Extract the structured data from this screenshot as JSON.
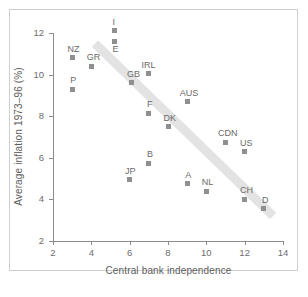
{
  "figure": {
    "background": "#ffffff",
    "frame_color": "#cfcfcf",
    "marker_color": "#8f8f8f",
    "trend_color": "#e2e2e2",
    "axis_color": "#8c8c8c",
    "text_color": "#6a6a6a"
  },
  "chart_data": {
    "type": "scatter",
    "title": "",
    "xlabel": "Central bank independence",
    "ylabel": "Average inflation 1973–96 (%)",
    "xlim": [
      2,
      14
    ],
    "ylim": [
      2,
      12
    ],
    "xticks": [
      2,
      4,
      6,
      8,
      10,
      12,
      14
    ],
    "yticks": [
      2,
      4,
      6,
      8,
      10,
      12
    ],
    "xtick_labels": [
      "2",
      "4",
      "6",
      "8",
      "10",
      "12",
      "14"
    ],
    "ytick_labels": [
      "2",
      "4",
      "6",
      "8",
      "10",
      "12"
    ],
    "grid": false,
    "legend": "none",
    "point_labels": [
      "NZ",
      "P",
      "GR",
      "I",
      "E",
      "JP",
      "GB",
      "B",
      "F",
      "IRL",
      "DK",
      "A",
      "AUS",
      "NL",
      "CDN",
      "US",
      "CH",
      "D"
    ],
    "x": [
      3.0,
      3.0,
      4.0,
      5.2,
      5.2,
      6.0,
      6.1,
      7.0,
      7.0,
      7.0,
      8.0,
      9.0,
      9.0,
      10.0,
      11.0,
      12.0,
      12.0,
      13.0
    ],
    "y": [
      10.8,
      9.3,
      10.4,
      12.1,
      11.6,
      4.95,
      9.6,
      5.75,
      8.15,
      10.05,
      7.5,
      4.75,
      8.7,
      4.4,
      6.75,
      6.3,
      4.0,
      3.55
    ],
    "points": [
      {
        "label": "NZ",
        "x": 3.0,
        "y": 10.8,
        "label_pos": "above"
      },
      {
        "label": "P",
        "x": 3.0,
        "y": 9.3,
        "label_pos": "above"
      },
      {
        "label": "GR",
        "x": 4.0,
        "y": 10.4,
        "label_pos": "above"
      },
      {
        "label": "I",
        "x": 5.2,
        "y": 12.1,
        "label_pos": "above"
      },
      {
        "label": "E",
        "x": 5.2,
        "y": 11.6,
        "label_pos": "below"
      },
      {
        "label": "JP",
        "x": 6.0,
        "y": 4.95,
        "label_pos": "above"
      },
      {
        "label": "GB",
        "x": 6.1,
        "y": 9.6,
        "label_pos": "above"
      },
      {
        "label": "B",
        "x": 7.0,
        "y": 5.75,
        "label_pos": "above"
      },
      {
        "label": "F",
        "x": 7.0,
        "y": 8.15,
        "label_pos": "above"
      },
      {
        "label": "IRL",
        "x": 7.0,
        "y": 10.05,
        "label_pos": "above"
      },
      {
        "label": "DK",
        "x": 8.0,
        "y": 7.5,
        "label_pos": "above"
      },
      {
        "label": "A",
        "x": 9.0,
        "y": 4.75,
        "label_pos": "above"
      },
      {
        "label": "AUS",
        "x": 9.0,
        "y": 8.7,
        "label_pos": "above"
      },
      {
        "label": "NL",
        "x": 10.0,
        "y": 4.4,
        "label_pos": "above"
      },
      {
        "label": "CDN",
        "x": 11.0,
        "y": 6.75,
        "label_pos": "above"
      },
      {
        "label": "US",
        "x": 12.0,
        "y": 6.3,
        "label_pos": "above"
      },
      {
        "label": "CH",
        "x": 12.0,
        "y": 4.0,
        "label_pos": "above"
      },
      {
        "label": "D",
        "x": 13.0,
        "y": 3.55,
        "label_pos": "above"
      }
    ],
    "trendline": {
      "kind": "band",
      "x_start": 4.2,
      "y_start": 11.5,
      "x_end": 13.5,
      "y_end": 3.2
    }
  }
}
